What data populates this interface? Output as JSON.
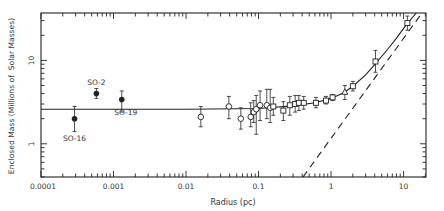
{
  "chart_data": {
    "type": "scatter",
    "title": "",
    "xlabel": "Radius (pc)",
    "ylabel": "Enclosed Mass (Millions of  Solar Masses)",
    "xscale": "log",
    "yscale": "log",
    "xlim": [
      0.0001,
      20.4
    ],
    "ylim": [
      0.4,
      37
    ],
    "xticks": [
      {
        "value": 0.0001,
        "label": "0.0001"
      },
      {
        "value": 0.001,
        "label": "0.001"
      },
      {
        "value": 0.01,
        "label": "0.01"
      },
      {
        "value": 0.1,
        "label": "0.1"
      },
      {
        "value": 1,
        "label": "1"
      },
      {
        "value": 10,
        "label": "10"
      }
    ],
    "yticks": [
      {
        "value": 1,
        "label": "1"
      },
      {
        "value": 10,
        "label": "10"
      }
    ],
    "grid": false,
    "legend": null,
    "series": [
      {
        "name": "Stellar orbits",
        "marker": "filled-circle",
        "points": [
          {
            "x": 0.00029,
            "y": 2.0,
            "ylo": 1.4,
            "yhi": 2.8,
            "label": "SO-16"
          },
          {
            "x": 0.00058,
            "y": 4.0,
            "ylo": 3.5,
            "yhi": 4.6,
            "label": "SO-2"
          },
          {
            "x": 0.0013,
            "y": 3.4,
            "ylo": 2.4,
            "yhi": 4.3,
            "label": "SO-19"
          }
        ]
      },
      {
        "name": "Open circles",
        "marker": "open-circle",
        "points": [
          {
            "x": 0.016,
            "y": 2.1,
            "ylo": 1.6,
            "yhi": 2.8
          },
          {
            "x": 0.039,
            "y": 2.8,
            "ylo": 2.0,
            "yhi": 3.7
          },
          {
            "x": 0.057,
            "y": 2.0,
            "ylo": 1.5,
            "yhi": 2.7
          },
          {
            "x": 0.078,
            "y": 2.1,
            "ylo": 1.6,
            "yhi": 3.1
          },
          {
            "x": 0.086,
            "y": 2.4,
            "ylo": 1.8,
            "yhi": 3.3
          },
          {
            "x": 0.093,
            "y": 2.6,
            "ylo": 1.3,
            "yhi": 3.8
          },
          {
            "x": 0.105,
            "y": 2.9,
            "ylo": 1.9,
            "yhi": 4.3
          },
          {
            "x": 0.13,
            "y": 2.9,
            "ylo": 2.0,
            "yhi": 4.5
          },
          {
            "x": 0.145,
            "y": 2.7,
            "ylo": 1.8,
            "yhi": 4.5
          }
        ]
      },
      {
        "name": "Open squares",
        "marker": "open-square",
        "points": [
          {
            "x": 0.16,
            "y": 2.8,
            "ylo": 2.2,
            "yhi": 3.6
          },
          {
            "x": 0.22,
            "y": 2.5,
            "ylo": 1.9,
            "yhi": 3.2
          },
          {
            "x": 0.27,
            "y": 2.9,
            "ylo": 2.2,
            "yhi": 3.7
          },
          {
            "x": 0.32,
            "y": 3.0,
            "ylo": 2.4,
            "yhi": 3.8
          },
          {
            "x": 0.36,
            "y": 3.1,
            "ylo": 2.5,
            "yhi": 3.8
          },
          {
            "x": 0.42,
            "y": 3.1,
            "ylo": 2.6,
            "yhi": 3.7
          },
          {
            "x": 0.62,
            "y": 3.1,
            "ylo": 2.7,
            "yhi": 3.6
          },
          {
            "x": 0.85,
            "y": 3.3,
            "ylo": 3.0,
            "yhi": 3.7
          },
          {
            "x": 1.05,
            "y": 3.6,
            "ylo": 3.3,
            "yhi": 3.9
          },
          {
            "x": 2.0,
            "y": 4.9,
            "ylo": 4.3,
            "yhi": 5.6
          },
          {
            "x": 4.1,
            "y": 9.7,
            "ylo": 7.2,
            "yhi": 13.2
          },
          {
            "x": 11.3,
            "y": 28,
            "ylo": 23,
            "yhi": 34
          }
        ]
      },
      {
        "name": "Triangle",
        "marker": "open-triangle",
        "points": [
          {
            "x": 1.55,
            "y": 4.2,
            "ylo": 3.4,
            "yhi": 5.0
          }
        ]
      }
    ],
    "lines": [
      {
        "name": "Total mass model (point mass + cluster)",
        "style": "solid",
        "points": [
          [
            0.0001,
            2.6
          ],
          [
            0.01,
            2.6
          ],
          [
            0.1,
            2.65
          ],
          [
            0.3,
            2.85
          ],
          [
            0.6,
            3.1
          ],
          [
            1.0,
            3.5
          ],
          [
            1.5,
            4.1
          ],
          [
            2.0,
            4.9
          ],
          [
            3.0,
            6.7
          ],
          [
            4.0,
            8.9
          ],
          [
            6.0,
            13.5
          ],
          [
            8.0,
            18.5
          ],
          [
            11.0,
            27
          ],
          [
            15.0,
            37
          ]
        ]
      },
      {
        "name": "Stellar cluster contribution",
        "style": "dashed",
        "points": [
          [
            0.41,
            0.4
          ],
          [
            17.4,
            35.7
          ]
        ]
      }
    ],
    "annotations": [
      {
        "text": "SO-2",
        "x": 0.00058,
        "y": 4.0,
        "position": "above"
      },
      {
        "text": "SO-19",
        "x": 0.0013,
        "y": 3.4,
        "position": "below"
      },
      {
        "text": "SO-16",
        "x": 0.00029,
        "y": 2.0,
        "position": "below"
      }
    ]
  },
  "plot_box": {
    "left": 41,
    "top": 13,
    "right": 426,
    "bottom": 177
  },
  "colors": {
    "ink": "#222222",
    "text": "#333333",
    "background": "#ffffff"
  }
}
